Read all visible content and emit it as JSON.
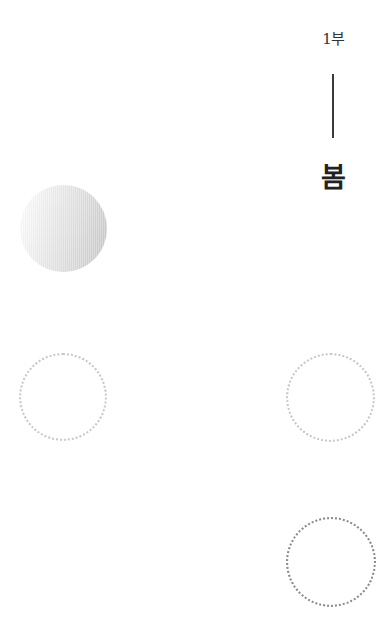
{
  "header": {
    "part_label": "1부",
    "season_title": "봄"
  },
  "decorations": {
    "filled_circle": {
      "gradient_from": "#ffffff",
      "gradient_to": "#c6c6c6"
    },
    "dotted_circles": [
      {
        "position": "left-middle",
        "color": "#c8c8c8"
      },
      {
        "position": "right-middle",
        "color": "#c8c8c8"
      },
      {
        "position": "right-bottom",
        "color": "#8a8a8a"
      }
    ]
  }
}
